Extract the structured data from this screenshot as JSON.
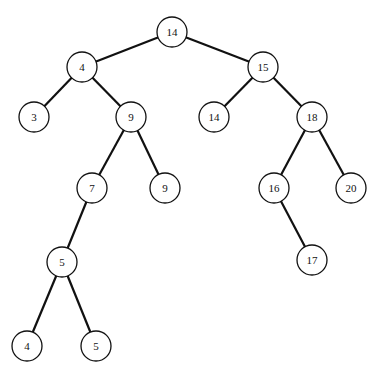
{
  "diagram": {
    "type": "binary-tree",
    "nodes": [
      {
        "id": "n14",
        "label": "14"
      },
      {
        "id": "n4",
        "label": "4"
      },
      {
        "id": "n3",
        "label": "3"
      },
      {
        "id": "n9a",
        "label": "9"
      },
      {
        "id": "n7",
        "label": "7"
      },
      {
        "id": "n9b",
        "label": "9"
      },
      {
        "id": "n5a",
        "label": "5"
      },
      {
        "id": "n4b",
        "label": "4"
      },
      {
        "id": "n5b",
        "label": "5"
      },
      {
        "id": "n15",
        "label": "15"
      },
      {
        "id": "n14b",
        "label": "14"
      },
      {
        "id": "n18",
        "label": "18"
      },
      {
        "id": "n16",
        "label": "16"
      },
      {
        "id": "n20",
        "label": "20"
      },
      {
        "id": "n17",
        "label": "17"
      }
    ],
    "edges": [
      [
        "n14",
        "n4"
      ],
      [
        "n14",
        "n15"
      ],
      [
        "n4",
        "n3"
      ],
      [
        "n4",
        "n9a"
      ],
      [
        "n9a",
        "n7"
      ],
      [
        "n9a",
        "n9b"
      ],
      [
        "n7",
        "n5a"
      ],
      [
        "n5a",
        "n4b"
      ],
      [
        "n5a",
        "n5b"
      ],
      [
        "n15",
        "n14b"
      ],
      [
        "n15",
        "n18"
      ],
      [
        "n18",
        "n16"
      ],
      [
        "n18",
        "n20"
      ],
      [
        "n16",
        "n17"
      ]
    ]
  }
}
